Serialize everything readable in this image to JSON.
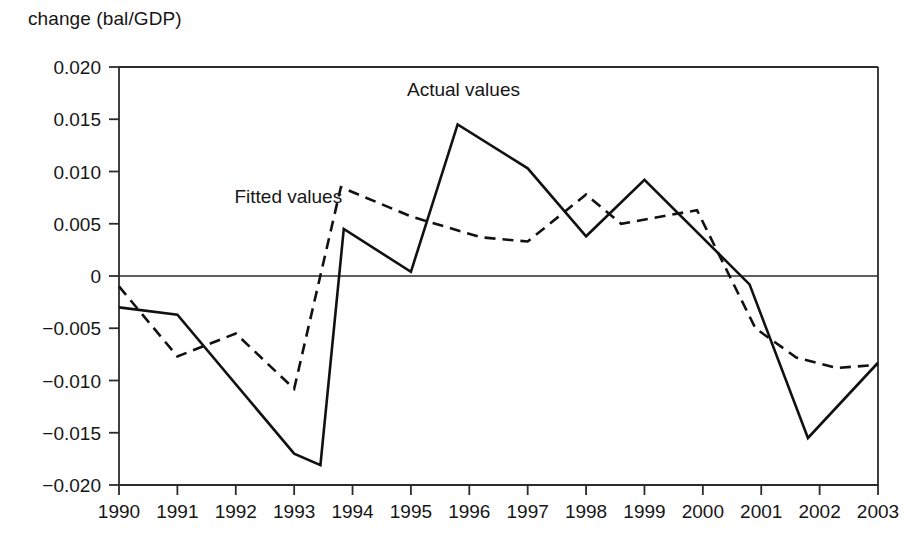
{
  "chart_data": {
    "type": "line",
    "title": "change (bal/GDP)",
    "xlabel": "",
    "ylabel": "change (bal/GDP)",
    "xlim": [
      1990,
      2003
    ],
    "ylim": [
      -0.02,
      0.02
    ],
    "grid": false,
    "legend_position": "inline-annotation",
    "y_ticks": [
      0.02,
      0.015,
      0.01,
      0.005,
      0,
      -0.005,
      -0.01,
      -0.015,
      -0.02
    ],
    "y_tick_labels": [
      "0.020",
      "0.015",
      "0.010",
      "0.005",
      "0",
      "−0.005",
      "−0.010",
      "−0.015",
      "−0.020"
    ],
    "x_ticks": [
      1990,
      1991,
      1992,
      1993,
      1994,
      1995,
      1996,
      1997,
      1998,
      1999,
      2000,
      2001,
      2002,
      2003
    ],
    "x_tick_labels": [
      "1990",
      "1991",
      "1992",
      "1993",
      "1994",
      "1995",
      "1996",
      "1997",
      "1998",
      "1999",
      "2000",
      "2001",
      "2002",
      "2003"
    ],
    "annotations": [
      {
        "text": "Actual values",
        "x": 1995.9,
        "y": 0.0172
      },
      {
        "text": "Fitted values",
        "x": 1992.9,
        "y": 0.007
      }
    ],
    "series": [
      {
        "name": "Actual values",
        "style": "solid",
        "color": "#111111",
        "points": [
          {
            "x": 1990.0,
            "y": -0.003
          },
          {
            "x": 1991.0,
            "y": -0.0037
          },
          {
            "x": 1993.0,
            "y": -0.017
          },
          {
            "x": 1993.45,
            "y": -0.0181
          },
          {
            "x": 1993.85,
            "y": 0.0045
          },
          {
            "x": 1995.0,
            "y": 0.0004
          },
          {
            "x": 1995.8,
            "y": 0.0145
          },
          {
            "x": 1997.0,
            "y": 0.0103
          },
          {
            "x": 1998.0,
            "y": 0.0038
          },
          {
            "x": 1999.0,
            "y": 0.0092
          },
          {
            "x": 2000.8,
            "y": -0.0008
          },
          {
            "x": 2001.8,
            "y": -0.0155
          },
          {
            "x": 2003.0,
            "y": -0.0083
          }
        ]
      },
      {
        "name": "Fitted values",
        "style": "dashed",
        "color": "#111111",
        "points": [
          {
            "x": 1990.0,
            "y": -0.001
          },
          {
            "x": 1991.0,
            "y": -0.0077
          },
          {
            "x": 1992.0,
            "y": -0.0055
          },
          {
            "x": 1993.0,
            "y": -0.0108
          },
          {
            "x": 1993.8,
            "y": 0.0085
          },
          {
            "x": 1995.0,
            "y": 0.0057
          },
          {
            "x": 1996.2,
            "y": 0.0037
          },
          {
            "x": 1997.0,
            "y": 0.0033
          },
          {
            "x": 1997.6,
            "y": 0.006
          },
          {
            "x": 1998.0,
            "y": 0.0078
          },
          {
            "x": 1998.6,
            "y": 0.005
          },
          {
            "x": 1999.4,
            "y": 0.0058
          },
          {
            "x": 1999.9,
            "y": 0.0063
          },
          {
            "x": 2000.9,
            "y": -0.005
          },
          {
            "x": 2001.6,
            "y": -0.0078
          },
          {
            "x": 2002.3,
            "y": -0.0088
          },
          {
            "x": 2003.0,
            "y": -0.0085
          }
        ]
      }
    ]
  }
}
